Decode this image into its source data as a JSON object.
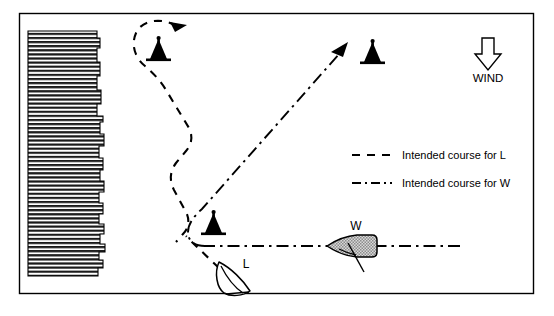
{
  "figure": {
    "type": "nautical-racing-diagram",
    "width": 554,
    "height": 316,
    "background": "#ffffff",
    "border_color": "#000000"
  },
  "wind": {
    "label": "WIND",
    "direction": "down",
    "arrow_icon": "wind-arrow-down-icon"
  },
  "legend": {
    "entries": [
      {
        "style": "dashed",
        "label": "Intended course for L"
      },
      {
        "style": "dash-dot",
        "label": "Intended course for W"
      }
    ]
  },
  "boats": [
    {
      "id": "L",
      "label": "L",
      "fill": "#ffffff",
      "stroke": "#000000",
      "heading": "up-left"
    },
    {
      "id": "W",
      "label": "W",
      "fill": "#b5b5b5",
      "stroke": "#000000",
      "heading": "left"
    }
  ],
  "marks": [
    {
      "name": "upper-left-buoy",
      "x": 158,
      "y": 55
    },
    {
      "name": "upper-right-buoy",
      "x": 372,
      "y": 58
    },
    {
      "name": "lower-center-buoy",
      "x": 213,
      "y": 229
    }
  ],
  "shore": {
    "name": "hatched-shoreline",
    "hatch_color": "#000000",
    "description": "horizontally hatched land mass on left edge"
  },
  "courses": {
    "L": {
      "style": "dashed",
      "color": "#000000",
      "arrowhead": "up-right at top of loop"
    },
    "W": {
      "style": "dash-dot",
      "color": "#000000",
      "arrowhead": "up-right toward upper-right buoy"
    }
  }
}
